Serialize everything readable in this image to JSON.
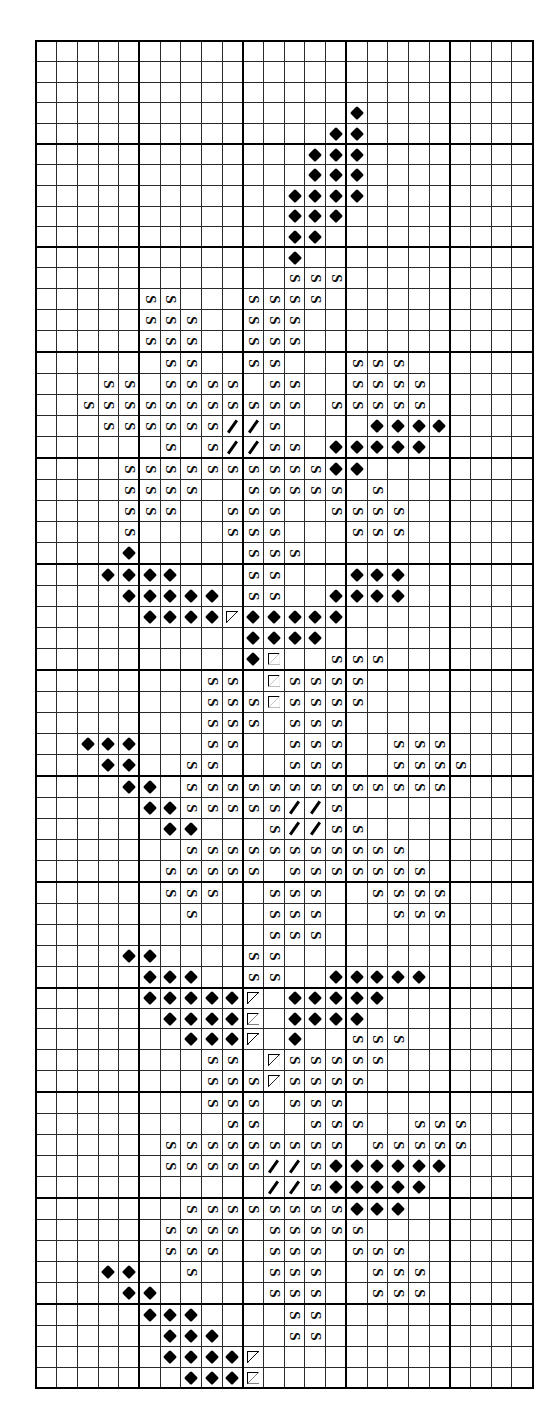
{
  "chart_meta": {
    "title": "Cross-Stitch / Needlepoint Pattern Chart",
    "kind": "counted-thread grid chart",
    "columns": 24,
    "rows": 64,
    "cell_px": 20.7,
    "bold_every": 5,
    "grid_line_color": "#2b2b2b",
    "bold_line_color": "#000000",
    "background_color": "#ffffff",
    "symbol_color": "#000000"
  },
  "legend": [
    {
      "key": "D",
      "name": "filled-diamond",
      "glyph": "♦",
      "label": "Filled diamond"
    },
    {
      "key": "S",
      "name": "rotated-s",
      "glyph": "S",
      "label": "Rotated S"
    },
    {
      "key": "/",
      "name": "diagonal-slash",
      "glyph": "╱",
      "label": "Diagonal slash"
    },
    {
      "key": "T",
      "name": "open-triangle",
      "glyph": "▷",
      "label": "Open triangle"
    }
  ],
  "chart_data": {
    "type": "heatmap",
    "xlabel": "",
    "ylabel": "",
    "columns": 24,
    "rows": 64,
    "legend_position": "none",
    "grid": true,
    "symbol_keys": [
      "D",
      "S",
      "/",
      "T"
    ],
    "cells": [
      "........................",
      "........................",
      "........................",
      "...............D........",
      "..............DD........",
      ".............DDD........",
      ".............DDD........",
      "............DDDD........",
      "............DDD.........",
      "............DD..........",
      "............D...........",
      "............SSS.........",
      ".....SS...SSSS..........",
      ".....SSS..SSS...........",
      ".....SSS..SSS...........",
      "......SS..SS...SSS......",
      "...SS.SSSS.SS..SSSS.....",
      "..SSSSSSSSSSS.SSSSS.....",
      "...SSSSSS//S....DDDD....",
      "......S.S//SS.DDDDD.....",
      "....SSSSSSSSSSDD........",
      "....SSSS..SSSSS.S.......",
      "....SSS..SSS..SSSS......",
      "....S....SSS...SSS......",
      "....D.....SSS...........",
      "...DDDD...SS...DDD......",
      "....DDDDD.SS..DDDD......",
      ".....DDDDTDDDDD.........",
      "..........DDDD..........",
      "..........DT..SSS.......",
      "........SS.TSSSS........",
      "........SSSTSSSS........",
      "........SSS.SSS.........",
      "..DDD...SS..SSS..SSS....",
      "...DD..SS...SSS..SSSS...",
      "....DD.SSSSSSSSSSSSS....",
      ".....DDSSSSS//S.........",
      "......DD...S//SS........",
      ".......SSSSSSSSSSS......",
      "......SSSSS.SSSSSSS.....",
      "......SSS..SSS..SSSS....",
      ".......S...SSS...SSS....",
      "...........SSS..........",
      "....DD....SS............",
      ".....DDD..SS..DDDDD.....",
      ".....DDDDDT.DDDDD.......",
      "......DDDDT.DDDD........",
      ".......DDDT.D..SSS......",
      "........SS.TSSSSS.......",
      "........SSSTSSSS........",
      "........SSS.SSS.........",
      ".........SS..SSS..SSS...",
      "......SSSSSSSSS.SSSSS...",
      "......SSSSS//SDDDDDD....",
      "...........//SDDDDD.....",
      ".......SSSSSSSSDDD......",
      "......SSSS.SSSSS........",
      "......SSS..SSS.SSS......",
      "...DD..S...SSS..SSS.....",
      "....DD.....SSS..SSS.....",
      ".....DDD....SS..........",
      "......DDD...SS..........",
      "......DDDDT.............",
      ".......DDDT.............",
      "..........T...D.........",
      ".........T...DD.........",
      "........T...DDD.........",
      "........T...DDD.........",
      "........T..DDD.........."
    ]
  }
}
